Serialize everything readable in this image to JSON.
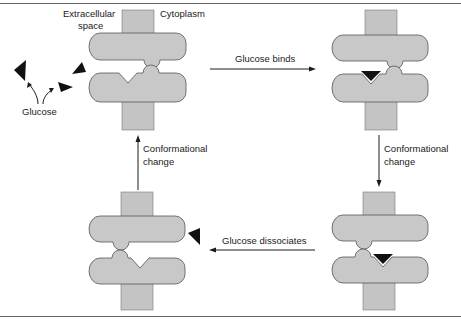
{
  "diagram": {
    "labels": {
      "extracellular_line1": "Extracellular",
      "extracellular_line2": "space",
      "cytoplasm": "Cytoplasm",
      "glucose": "Glucose",
      "step_bind": "Glucose binds",
      "step_conf_right_line1": "Conformational",
      "step_conf_right_line2": "change",
      "step_dissociate": "Glucose dissociates",
      "step_conf_left_line1": "Conformational",
      "step_conf_left_line2": "change"
    },
    "states": [
      {
        "id": "state-1",
        "position": "top-left",
        "glucose_bound": false,
        "open_side": "extracellular"
      },
      {
        "id": "state-2",
        "position": "top-right",
        "glucose_bound": true,
        "open_side": "extracellular"
      },
      {
        "id": "state-3",
        "position": "bottom-right",
        "glucose_bound": true,
        "open_side": "cytoplasm"
      },
      {
        "id": "state-4",
        "position": "bottom-left",
        "glucose_bound": false,
        "open_side": "cytoplasm"
      }
    ],
    "colors": {
      "protein": "#c8c8c8",
      "membrane": "#c4c4c4",
      "glucose": "#111111",
      "arrow": "#1a1a1a"
    }
  }
}
